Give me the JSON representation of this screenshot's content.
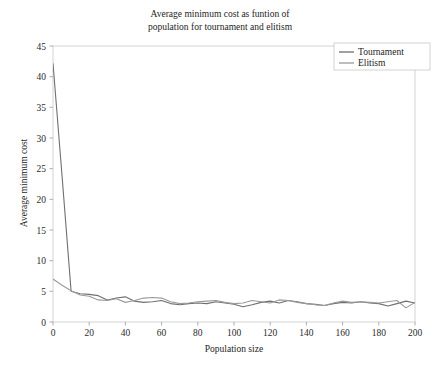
{
  "chart_data": {
    "type": "line",
    "title": "Average minimum cost as funtion of\npopulation for tournament and elitism",
    "xlabel": "Population size",
    "ylabel": "Average minimum cost",
    "xlim": [
      0,
      200
    ],
    "ylim": [
      0,
      45
    ],
    "xticks": [
      0,
      20,
      40,
      60,
      80,
      100,
      120,
      140,
      160,
      180,
      200
    ],
    "yticks": [
      0,
      5,
      10,
      15,
      20,
      25,
      30,
      35,
      40,
      45
    ],
    "grid": false,
    "legend_position": "top-right",
    "colors": {
      "tournament": "#6f6f6f",
      "elitism": "#9a9a9a",
      "axis": "#9a9a9a",
      "frame": "#c8c8c8",
      "text": "#1d1d1d"
    },
    "x": [
      0,
      5,
      10,
      15,
      20,
      25,
      30,
      35,
      40,
      45,
      50,
      55,
      60,
      65,
      70,
      75,
      80,
      85,
      90,
      95,
      100,
      105,
      110,
      115,
      120,
      125,
      130,
      135,
      140,
      145,
      150,
      155,
      160,
      165,
      170,
      175,
      180,
      185,
      190,
      195,
      200
    ],
    "series": [
      {
        "name": "Tournament",
        "color": "#6f6f6f",
        "values": [
          42.2,
          23.8,
          5.0,
          4.6,
          4.5,
          4.3,
          3.6,
          3.9,
          4.1,
          3.4,
          3.2,
          3.3,
          3.5,
          3.0,
          2.8,
          3.0,
          3.1,
          3.0,
          3.3,
          3.1,
          2.9,
          2.5,
          2.8,
          3.2,
          3.4,
          3.1,
          3.5,
          3.3,
          3.0,
          2.9,
          2.7,
          3.0,
          3.2,
          3.1,
          3.3,
          3.1,
          3.0,
          2.6,
          3.0,
          3.4,
          3.1
        ]
      },
      {
        "name": "Elitism",
        "color": "#9a9a9a",
        "values": [
          7.0,
          6.0,
          5.1,
          4.4,
          4.2,
          3.6,
          3.5,
          3.8,
          3.2,
          3.5,
          3.9,
          4.0,
          3.9,
          3.3,
          3.0,
          3.1,
          3.3,
          3.4,
          3.5,
          3.2,
          3.0,
          3.1,
          3.5,
          3.3,
          3.1,
          3.6,
          3.5,
          3.2,
          3.0,
          2.8,
          2.7,
          3.1,
          3.4,
          3.2,
          3.3,
          3.2,
          3.1,
          3.3,
          3.5,
          2.3,
          3.2
        ]
      }
    ]
  },
  "legend": {
    "items": [
      {
        "label": "Tournament"
      },
      {
        "label": "Elitism"
      }
    ]
  }
}
